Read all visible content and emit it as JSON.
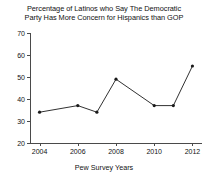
{
  "chart_data": {
    "type": "line",
    "title": "Percentage of Latinos who Say The Democratic Party Has More Concern for Hispanics than GOP",
    "title_line1": "Percentage of Latinos who Say The Democratic",
    "title_line2": "Party Has More Concern for Hispanics than GOP",
    "xlabel": "Pew Survey Years",
    "ylabel": "",
    "x": [
      2004,
      2006,
      2007,
      2008,
      2010,
      2011,
      2012
    ],
    "values": [
      34,
      37,
      34,
      49,
      37,
      37,
      55
    ],
    "series": [
      {
        "name": "Percentage of Latinos",
        "values": [
          34,
          37,
          34,
          49,
          37,
          37,
          55
        ]
      }
    ],
    "xlim": [
      2003.5,
      2012.5
    ],
    "ylim": [
      20,
      70
    ],
    "xticks": [
      2004,
      2006,
      2008,
      2010,
      2012
    ],
    "xtick_labels": [
      "2004",
      "2006",
      "2008",
      "2010",
      "2012"
    ],
    "yticks": [
      20,
      30,
      40,
      50,
      60,
      70
    ],
    "ytick_labels": [
      "20",
      "30",
      "40",
      "50",
      "60",
      "70"
    ],
    "grid": false,
    "legend": "none",
    "line_color": "#1a1a1a",
    "marker_color": "#1a1a1a",
    "background_color": "#ffffff"
  }
}
